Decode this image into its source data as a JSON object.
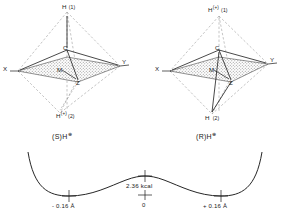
{
  "figure": {
    "left_structure": {
      "name": "S-enantiomer",
      "stereo_label": "(S)H",
      "stereo_charge": "⊕",
      "apex_top": "H",
      "apex_top_index": "(1)",
      "apex_bottom": "H",
      "apex_bottom_charge": "(+)",
      "apex_bottom_index": "(2)",
      "center_atom": "C",
      "left_vertex": "X",
      "right_vertex": "Y",
      "plane_atom_m": "M",
      "plane_atom_z": "Z"
    },
    "right_structure": {
      "name": "R-enantiomer",
      "stereo_label": "(R)H",
      "stereo_charge": "⊕",
      "apex_top": "H",
      "apex_top_charge": "(+)",
      "apex_top_index": "(1)",
      "apex_bottom": "H",
      "apex_bottom_index": "(2)",
      "center_atom": "C",
      "left_vertex": "X",
      "right_vertex": "Y",
      "plane_atom_m": "M",
      "plane_atom_z": "Z"
    },
    "energy_curve": {
      "barrier_label": "2.36 kcal",
      "tick_left": "- 0.16 Å",
      "tick_center": "0",
      "tick_right": "+ 0.16 Å"
    },
    "colors": {
      "stroke": "#1a1a1a",
      "dashed": "#7a7a7a",
      "plane_fill": "#b4b4b4",
      "text": "#1a1a1a"
    }
  }
}
